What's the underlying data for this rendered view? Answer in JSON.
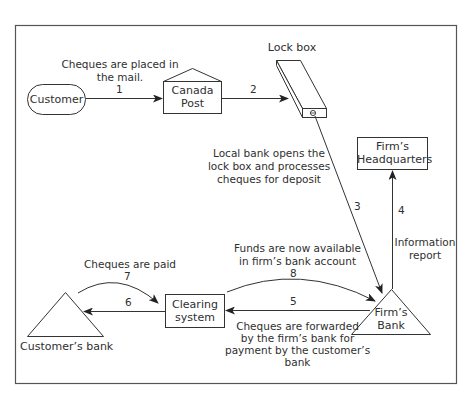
{
  "diagram": {
    "colors": {
      "stroke": "#3a3a3a",
      "background": "#ffffff",
      "text": "#2f2f2f"
    },
    "nodes": {
      "customer": {
        "label": "Customer",
        "shape": "rounded-pill"
      },
      "canada_post": {
        "line1": "Canada",
        "line2": "Post",
        "shape": "house"
      },
      "lock_box": {
        "label": "Lock box",
        "shape": "3d-box"
      },
      "firms_hq": {
        "line1": "Firm’s",
        "line2": "Headquarters",
        "shape": "rectangle"
      },
      "firms_bank": {
        "line1": "Firm’s",
        "line2": "Bank",
        "shape": "triangle"
      },
      "clearing_system": {
        "line1": "Clearing",
        "line2": "system",
        "shape": "rectangle"
      },
      "customers_bank": {
        "label": "Customer’s bank",
        "shape": "triangle"
      }
    },
    "edges": [
      {
        "step": "1",
        "from": "customer",
        "to": "canada_post",
        "label_line1": "Cheques are placed in",
        "label_line2": "the mail."
      },
      {
        "step": "2",
        "from": "canada_post",
        "to": "lock_box"
      },
      {
        "step": "3",
        "from": "lock_box",
        "to": "firms_bank",
        "label_line1": "Local bank opens the",
        "label_line2": "lock box and processes",
        "label_line3": "cheques for deposit"
      },
      {
        "step": "4",
        "from": "firms_bank",
        "to": "firms_hq",
        "label_line1": "Information",
        "label_line2": "report"
      },
      {
        "step": "5",
        "from": "firms_bank",
        "to": "clearing_system",
        "label_line1": "Cheques are forwarded",
        "label_line2": "by the firm’s bank for",
        "label_line3": "payment by the customer’s",
        "label_line4": "bank"
      },
      {
        "step": "6",
        "from": "clearing_system",
        "to": "customers_bank"
      },
      {
        "step": "7",
        "from": "customers_bank",
        "to": "clearing_system",
        "label_line1": "Cheques are paid"
      },
      {
        "step": "8",
        "from": "clearing_system",
        "to": "firms_bank",
        "label_line1": "Funds are now available",
        "label_line2": "in firm’s bank account"
      }
    ]
  }
}
